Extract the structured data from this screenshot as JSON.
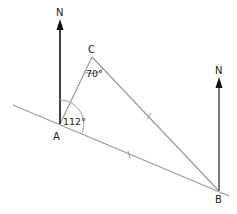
{
  "diagram": {
    "type": "bearing-geometry",
    "points": {
      "A": {
        "label": "A",
        "x": 60,
        "y": 124
      },
      "B": {
        "label": "B",
        "x": 219,
        "y": 191
      },
      "C": {
        "label": "C",
        "x": 92,
        "y": 57
      }
    },
    "north_labels": {
      "at_A": "N",
      "at_B": "N"
    },
    "angles": {
      "at_A": "112°",
      "at_C": "70°"
    },
    "equal_side_marks": [
      "AB",
      "BC"
    ],
    "colors": {
      "line": "#999999",
      "arrow": "#111111"
    }
  }
}
